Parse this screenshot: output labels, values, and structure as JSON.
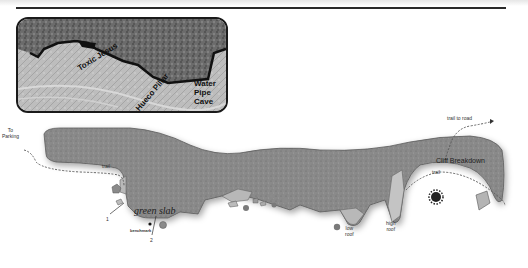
{
  "photo": {
    "labels": {
      "route1": "Toxic Jesus",
      "route2": "Hueco Pillar",
      "water_pipe": [
        "Water",
        "Pipe",
        "Cave"
      ]
    }
  },
  "map": {
    "labels": {
      "to_parking": [
        "To",
        "Parking"
      ],
      "trail_left": "trail",
      "trail_right": "trail",
      "trail_to_road": "trail to road",
      "cliff_breakdown": "Cliff Breakdown",
      "green_slab": "green slab",
      "benchmark": "benchmark",
      "marker_1": "1",
      "marker_2": "2",
      "low_roof": [
        "low",
        "roof"
      ],
      "high_roof": [
        "high",
        "roof"
      ]
    },
    "colors": {
      "cliff": "#8a8a8a",
      "cliff_edge": "#555555",
      "ledge": "#b4b4b4",
      "trail": "#555555"
    }
  }
}
